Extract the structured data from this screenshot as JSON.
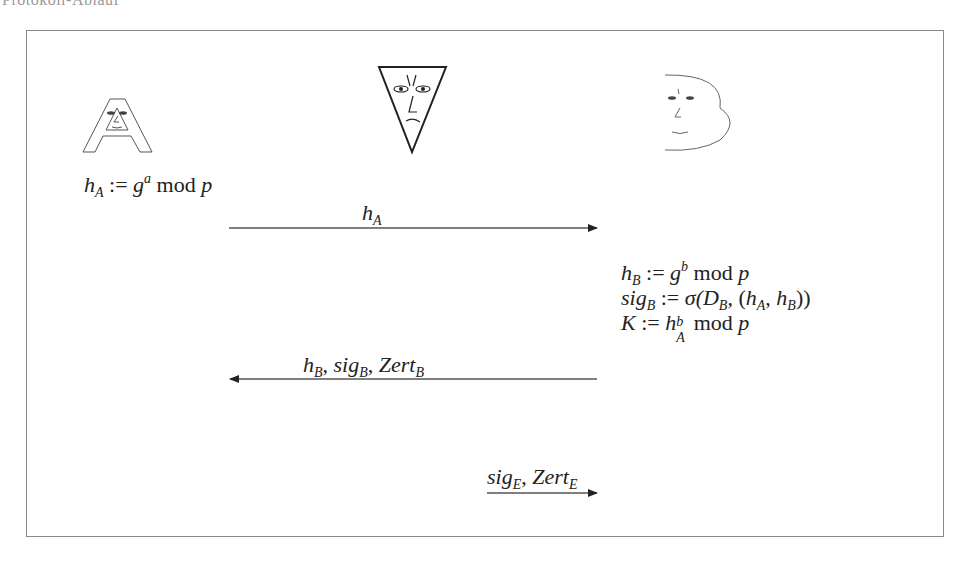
{
  "caption_cutoff": "Protokoll-Ablauf",
  "participants": [
    {
      "id": "A",
      "name": "Alice",
      "icon": "letter-a-face-icon"
    },
    {
      "id": "E",
      "name": "Eve",
      "icon": "inverted-triangle-face-icon"
    },
    {
      "id": "B",
      "name": "Bob",
      "icon": "letter-b-face-icon"
    }
  ],
  "alice_computation": {
    "lhs": "h",
    "lhs_sub": "A",
    "op": " := ",
    "base": "g",
    "exp": "a",
    "mod": " mod ",
    "p": "p"
  },
  "bob_computations": [
    {
      "lhs": "h",
      "lhs_sub": "B",
      "op": " := ",
      "base": "g",
      "exp": "b",
      "mod": " mod ",
      "p": "p"
    },
    {
      "lhs": "sig",
      "lhs_sub": "B",
      "op": " := ",
      "sigma": "σ(",
      "D": "D",
      "D_sub": "B",
      "rest1": ", (",
      "hA": "h",
      "hA_sub": "A",
      "comma": ", ",
      "hB": "h",
      "hB_sub": "B",
      "close": "))"
    },
    {
      "lhs": "K",
      "op": " := ",
      "base": "h",
      "sup": "b",
      "sub": "A",
      "mod": " mod ",
      "p": "p"
    }
  ],
  "messages": [
    {
      "label_main": "h",
      "label_sub": "A",
      "direction": "right",
      "from": "A",
      "to": "B"
    },
    {
      "parts": [
        {
          "t": "h",
          "s": "B"
        },
        {
          "t": "sig",
          "s": "B"
        },
        {
          "t": "Zert",
          "s": "B"
        }
      ],
      "direction": "left",
      "from": "B",
      "to": "A"
    },
    {
      "parts": [
        {
          "t": "sig",
          "s": "E"
        },
        {
          "t": "Zert",
          "s": "E"
        }
      ],
      "direction": "right",
      "from": "E",
      "to": "B"
    }
  ],
  "colors": {
    "frame": "#8a8a8a",
    "ink": "#222222",
    "line": "#555555"
  }
}
